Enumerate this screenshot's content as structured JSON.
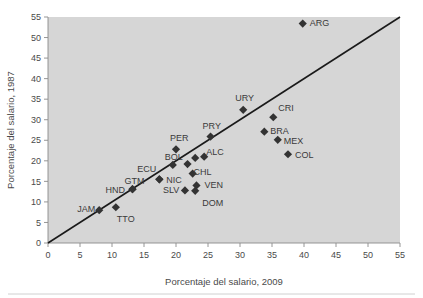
{
  "chart_data": {
    "type": "scatter",
    "title": "",
    "xlabel": "Porcentaje del salario, 2009",
    "ylabel": "Porcentaje del salario, 1987",
    "xlim": [
      0,
      55
    ],
    "ylim": [
      0,
      55
    ],
    "xticks": [
      0,
      5,
      10,
      15,
      20,
      25,
      30,
      35,
      40,
      45,
      50,
      55
    ],
    "yticks": [
      0,
      5,
      10,
      15,
      20,
      25,
      30,
      35,
      40,
      45,
      50,
      55
    ],
    "grid": false,
    "legend": "none",
    "annotations": [
      "45-degree identity reference line from (0,0) to (55,55)"
    ],
    "reference_line": {
      "from": [
        0,
        0
      ],
      "to": [
        55,
        55
      ]
    },
    "marker_shape": "diamond",
    "marker_color": "#333333",
    "plot_background": "#d6d6d6",
    "points": [
      {
        "label": "JAM",
        "x": 8.0,
        "y": 8.0,
        "label_dx": -22,
        "label_dy": 2
      },
      {
        "label": "TTO",
        "x": 10.6,
        "y": 8.7,
        "label_dx": 1,
        "label_dy": 15
      },
      {
        "label": "HND",
        "x": 13.2,
        "y": 13.1,
        "label_dx": -27,
        "label_dy": 4
      },
      {
        "label": "GTM",
        "x": 13.2,
        "y": 13.1,
        "label_dx": -8,
        "label_dy": -5
      },
      {
        "label": "ECU",
        "x": 17.4,
        "y": 15.5,
        "label_dx": -22,
        "label_dy": -7
      },
      {
        "label": "NIC",
        "x": 17.4,
        "y": 15.5,
        "label_dx": 7,
        "label_dy": 4
      },
      {
        "label": "PER",
        "x": 20.0,
        "y": 22.8,
        "label_dx": -6,
        "label_dy": -8
      },
      {
        "label": "BOL",
        "x": 19.5,
        "y": 19.0,
        "label_dx": -8,
        "label_dy": -5
      },
      {
        "label": "SLV",
        "x": 21.4,
        "y": 12.8,
        "label_dx": -22,
        "label_dy": 3
      },
      {
        "label": "CHL",
        "x": 21.8,
        "y": 19.2,
        "label_dx": 6,
        "label_dy": 11
      },
      {
        "label": "VEN",
        "x": 23.2,
        "y": 14.0,
        "label_dx": 8,
        "label_dy": 3
      },
      {
        "label": "DOM",
        "x": 23.0,
        "y": 12.7,
        "label_dx": 7,
        "label_dy": 15
      },
      {
        "label": "ALC",
        "x": 23.0,
        "y": 20.7,
        "label_dx": 11,
        "label_dy": -3
      },
      {
        "label": "PRY",
        "x": 25.4,
        "y": 25.9,
        "label_dx": -8,
        "label_dy": -8
      },
      {
        "label": "URY",
        "x": 30.5,
        "y": 32.4,
        "label_dx": -8,
        "label_dy": -9
      },
      {
        "label": "BRA",
        "x": 33.8,
        "y": 27.1,
        "label_dx": 6,
        "label_dy": 2
      },
      {
        "label": "CRI",
        "x": 35.2,
        "y": 30.6,
        "label_dx": 5,
        "label_dy": -6
      },
      {
        "label": "MEX",
        "x": 35.9,
        "y": 25.1,
        "label_dx": 6,
        "label_dy": 4
      },
      {
        "label": "COL",
        "x": 37.5,
        "y": 21.6,
        "label_dx": 7,
        "label_dy": 4
      },
      {
        "label": "ARG",
        "x": 39.8,
        "y": 53.4,
        "label_dx": 7,
        "label_dy": 2
      }
    ],
    "extra_markers": [
      {
        "x": 22.6,
        "y": 16.9
      },
      {
        "x": 24.4,
        "y": 21.0
      }
    ]
  }
}
